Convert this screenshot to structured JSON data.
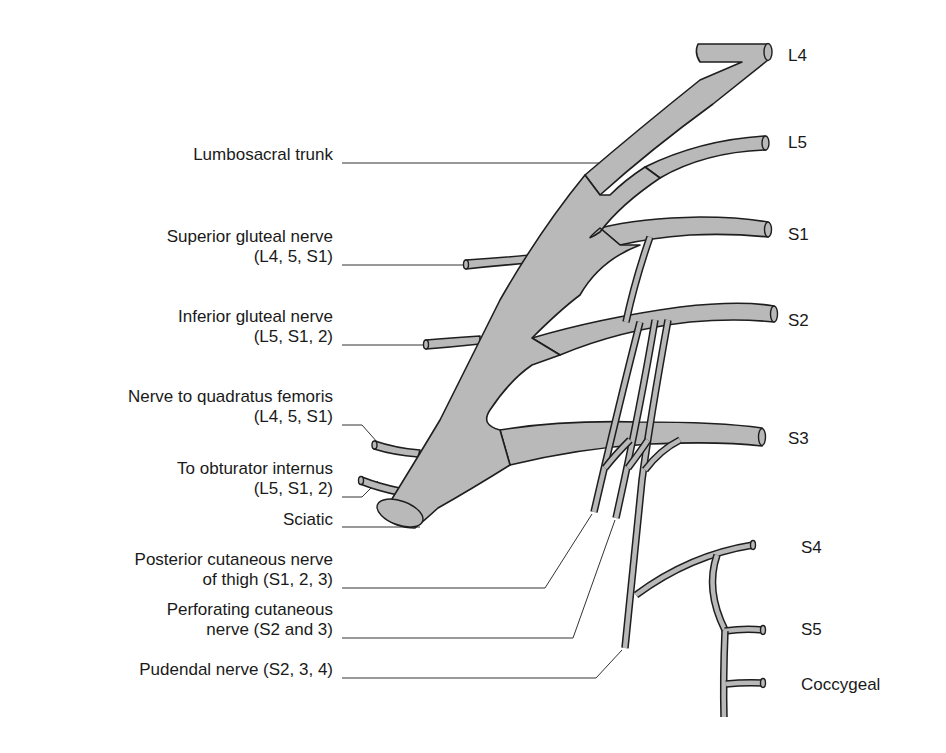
{
  "figure": {
    "type": "anatomical diagram",
    "colors": {
      "nerve_fill": "#b9b9b9",
      "nerve_outline": "#1e1e1e",
      "leader_line": "#333333",
      "text": "#1a1a1a",
      "background": "#ffffff"
    }
  },
  "roots": [
    {
      "id": "L4",
      "label": "L4"
    },
    {
      "id": "L5",
      "label": "L5"
    },
    {
      "id": "S1",
      "label": "S1"
    },
    {
      "id": "S2",
      "label": "S2"
    },
    {
      "id": "S3",
      "label": "S3"
    },
    {
      "id": "S4",
      "label": "S4"
    },
    {
      "id": "S5",
      "label": "S5"
    },
    {
      "id": "coccygeal",
      "label": "Coccygeal"
    }
  ],
  "branches": [
    {
      "id": "lumbosacral-trunk",
      "lines": [
        "Lumbosacral trunk"
      ]
    },
    {
      "id": "superior-gluteal",
      "lines": [
        "Superior gluteal nerve",
        "(L4, 5, S1)"
      ]
    },
    {
      "id": "inferior-gluteal",
      "lines": [
        "Inferior gluteal nerve",
        "(L5, S1, 2)"
      ]
    },
    {
      "id": "quadratus-femoris",
      "lines": [
        "Nerve to quadratus femoris",
        "(L4, 5, S1)"
      ]
    },
    {
      "id": "obturator-internus",
      "lines": [
        "To obturator internus",
        "(L5, S1, 2)"
      ]
    },
    {
      "id": "sciatic",
      "lines": [
        "Sciatic"
      ]
    },
    {
      "id": "posterior-cutaneous",
      "lines": [
        "Posterior cutaneous nerve",
        "of thigh (S1, 2, 3)"
      ]
    },
    {
      "id": "perforating-cutaneous",
      "lines": [
        "Perforating cutaneous",
        "nerve (S2 and 3)"
      ]
    },
    {
      "id": "pudendal",
      "lines": [
        "Pudendal nerve (S2, 3, 4)"
      ]
    }
  ]
}
